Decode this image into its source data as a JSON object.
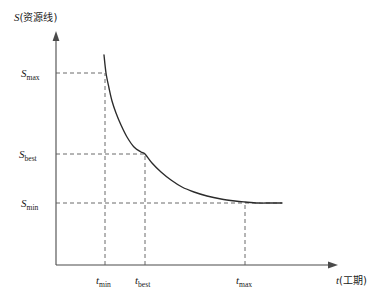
{
  "figure": {
    "background_color": "#ffffff",
    "axis_color": "#4a4a4a",
    "curve_color": "#2b2b2b",
    "guide_color": "#5a5a5a"
  },
  "axes": {
    "y": {
      "symbol": "S",
      "paren_open": "(",
      "name": "资源线",
      "paren_close": ")",
      "full_label": "S(资源线)"
    },
    "x": {
      "symbol": "t",
      "paren_open": "(",
      "name": "工期",
      "paren_close": ")",
      "full_label": "t(工期)"
    }
  },
  "y_ticks": [
    {
      "symbol": "S",
      "subscript": "max",
      "label": "Smax",
      "value": 73
    },
    {
      "symbol": "S",
      "subscript": "best",
      "label": "Sbest",
      "value": 154
    },
    {
      "symbol": "S",
      "subscript": "min",
      "label": "Smin",
      "value": 203
    }
  ],
  "x_ticks": [
    {
      "symbol": "t",
      "subscript": "min",
      "label": "tmin",
      "value": 105
    },
    {
      "symbol": "t",
      "subscript": "best",
      "label": "tbest",
      "value": 145
    },
    {
      "symbol": "t",
      "subscript": "max",
      "label": "tmax",
      "value": 245
    }
  ],
  "chart_data": {
    "type": "line",
    "title": "",
    "xlabel": "t(工期)",
    "ylabel": "S(资源线)",
    "grid": false,
    "legend": "none",
    "xlim": [
      56,
      338
    ],
    "ylim": [
      265,
      32
    ],
    "annotations": [
      {
        "text": "Smax",
        "axis": "y",
        "at": 73
      },
      {
        "text": "Sbest",
        "axis": "y",
        "at": 154
      },
      {
        "text": "Smin",
        "axis": "y",
        "at": 203
      },
      {
        "text": "tmin",
        "axis": "x",
        "at": 105
      },
      {
        "text": "tbest",
        "axis": "x",
        "at": 145
      },
      {
        "text": "tmax",
        "axis": "x",
        "at": 245
      }
    ],
    "series": [
      {
        "name": "resource-duration-curve",
        "x": [
          104,
          106,
          109,
          112,
          116,
          121,
          127,
          134,
          141,
          145,
          152,
          161,
          171,
          182,
          194,
          207,
          221,
          235,
          245,
          258,
          270,
          282
        ],
        "y": [
          55,
          73,
          88,
          101,
          113,
          125,
          137,
          147,
          152,
          154,
          163,
          172,
          180,
          187,
          192,
          196,
          199,
          201,
          202,
          203,
          203,
          203
        ]
      }
    ]
  }
}
